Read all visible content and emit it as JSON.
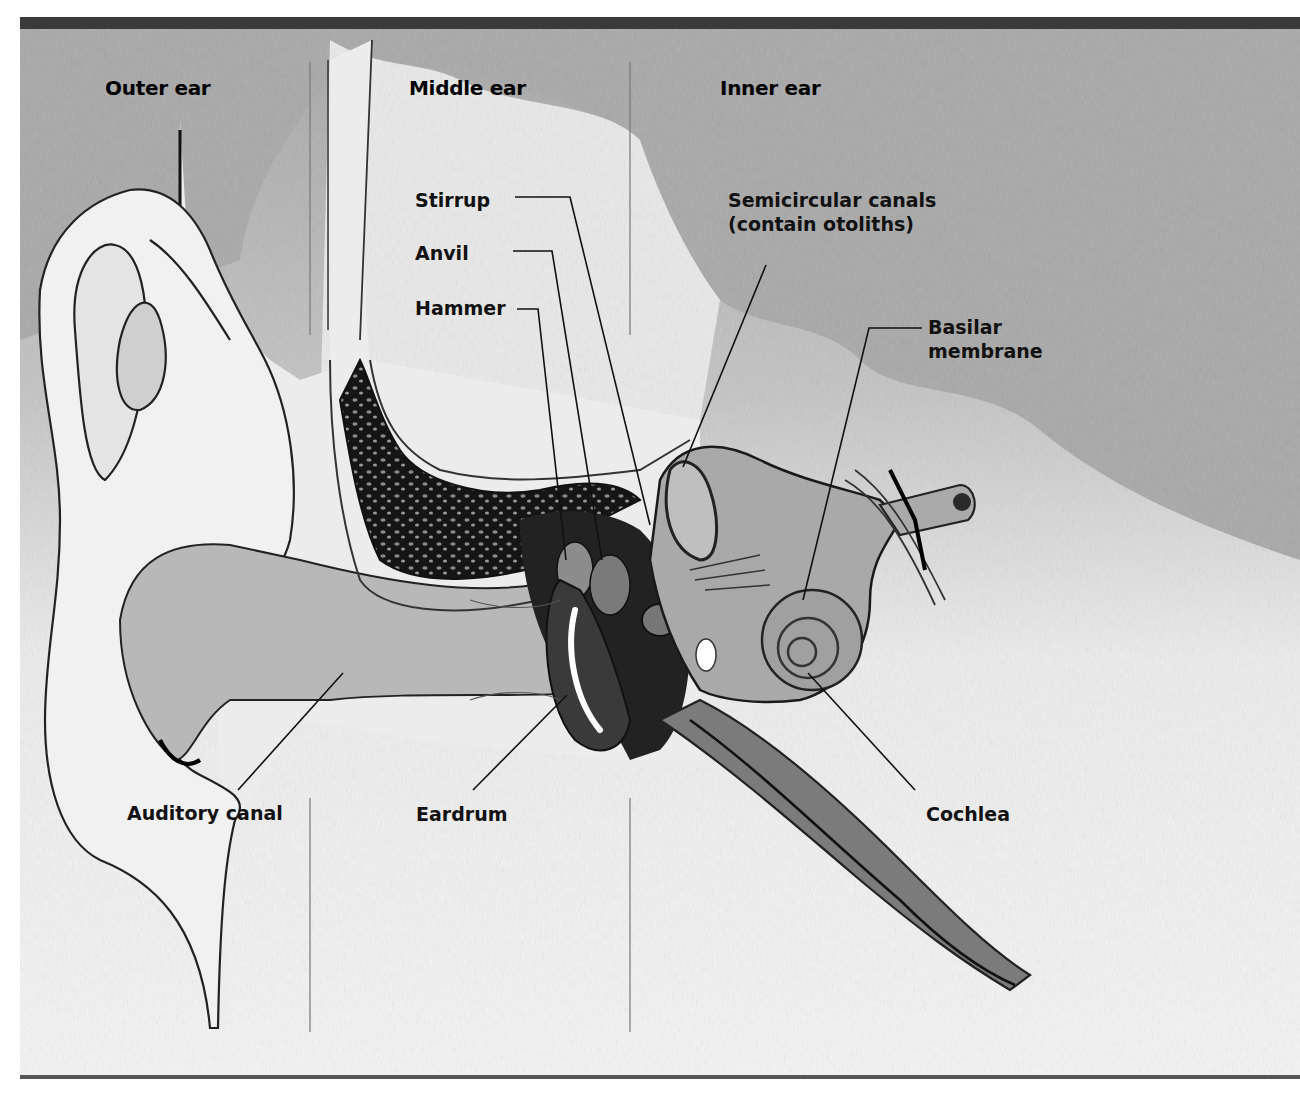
{
  "diagram": {
    "section_headers": [
      {
        "id": "outer",
        "label": "Outer ear"
      },
      {
        "id": "middle",
        "label": "Middle ear"
      },
      {
        "id": "inner",
        "label": "Inner ear"
      }
    ],
    "labels": {
      "stirrup": "Stirrup",
      "anvil": "Anvil",
      "hammer": "Hammer",
      "semicircular_line1": "Semicircular canals",
      "semicircular_line2": "(contain otoliths)",
      "basilar_line1": "Basilar",
      "basilar_line2": "membrane",
      "auditory_canal": "Auditory canal",
      "eardrum": "Eardrum",
      "cochlea": "Cochlea"
    },
    "colors": {
      "border": "#3a3a3a",
      "background_texture": "#a9a9a9",
      "tissue_light": "#e6e6e6",
      "tissue_mid": "#b4b4b4",
      "tissue_dark": "#1a1a1a",
      "leader_line": "#111111",
      "divider_line": "#777777"
    }
  }
}
